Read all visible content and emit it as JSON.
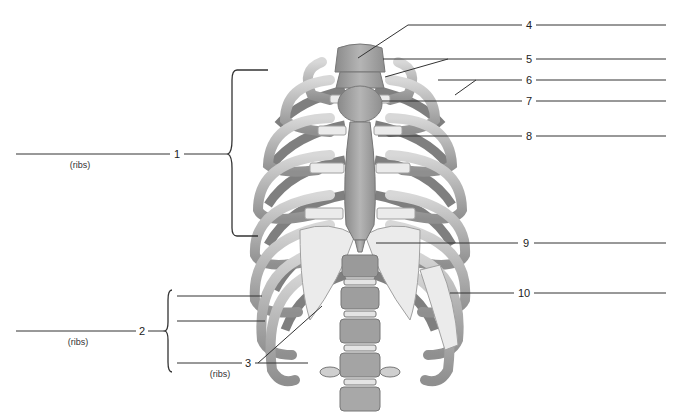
{
  "diagram": {
    "colors": {
      "background": "#ffffff",
      "bone": "#c9c9c9",
      "bone_shadow": "#8e8e8e",
      "cartilage": "#e6e6e6",
      "sternum": "#a5a5a5",
      "leader_line": "#333333"
    },
    "left_labels": [
      {
        "number": "1",
        "sublabel": "(ribs)"
      },
      {
        "number": "2",
        "sublabel": "(ribs)"
      },
      {
        "number": "3",
        "sublabel": "(ribs)"
      }
    ],
    "right_labels": [
      {
        "number": "4"
      },
      {
        "number": "5"
      },
      {
        "number": "6"
      },
      {
        "number": "7"
      },
      {
        "number": "8"
      },
      {
        "number": "9"
      },
      {
        "number": "10"
      }
    ]
  }
}
